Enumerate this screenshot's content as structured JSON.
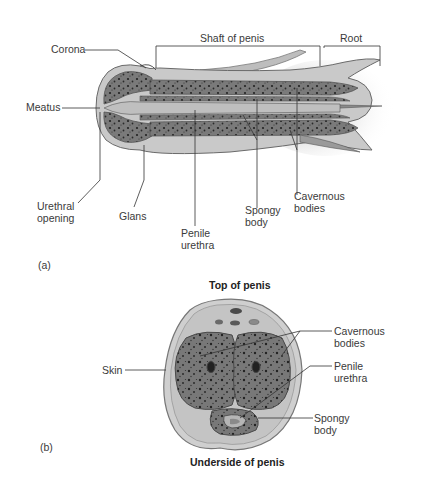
{
  "figure_a": {
    "panel_label": "(a)",
    "view": "longitudinal section",
    "labels": {
      "corona": "Corona",
      "meatus": "Meatus",
      "shaft": "Shaft of penis",
      "root": "Root",
      "urethral_opening": "Urethral\nopening",
      "glans": "Glans",
      "penile_urethra": "Penile\nurethra",
      "spongy_body": "Spongy\nbody",
      "cavernous_bodies": "Cavernous\nbodies"
    }
  },
  "figure_b": {
    "panel_label": "(b)",
    "view": "cross section",
    "top_caption": "Top of penis",
    "bottom_caption": "Underside of penis",
    "labels": {
      "skin": "Skin",
      "cavernous_bodies": "Cavernous\nbodies",
      "penile_urethra": "Penile\nurethra",
      "spongy_body": "Spongy\nbody"
    }
  },
  "colors": {
    "tissue_dark": "#6e6e6e",
    "tissue_mid": "#a8a8a8",
    "tissue_light": "#cfcfcf",
    "outline": "#5a5a5a",
    "leader": "#333333"
  }
}
